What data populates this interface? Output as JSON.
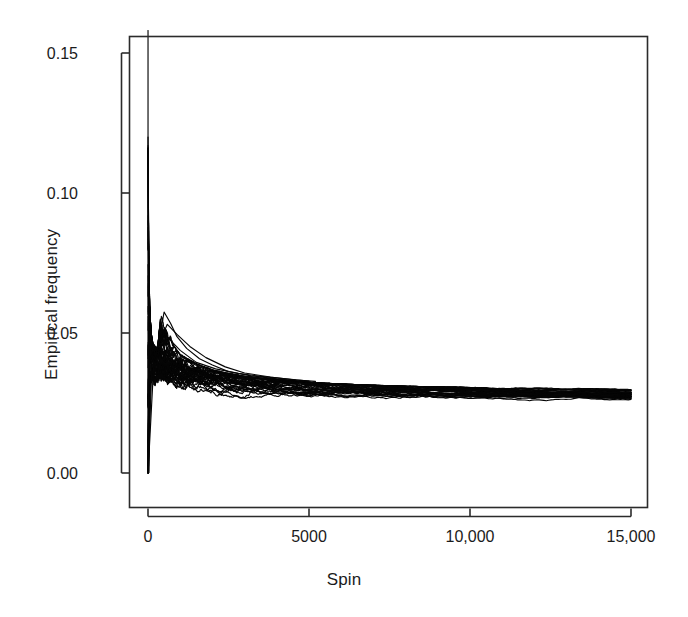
{
  "chart_data": {
    "type": "line",
    "title": "",
    "subtitle": "",
    "xlabel": "Spin",
    "ylabel": "Empirical frequency",
    "xlim": [
      -300,
      15600
    ],
    "ylim": [
      -0.0125,
      0.1585
    ],
    "grid": false,
    "legend": "none",
    "annotations": [],
    "xticks": [
      0,
      5000,
      10000,
      15000
    ],
    "xtick_labels": [
      "0",
      "5000",
      "10,000",
      "15,000"
    ],
    "yticks": [
      0.0,
      0.05,
      0.1,
      0.15
    ],
    "ytick_labels": [
      "0.00",
      "0.05",
      "0.10",
      "0.15"
    ],
    "series_count": 38,
    "converged_value": 0.0263,
    "final_band": [
      0.0243,
      0.0307
    ],
    "x": [
      1,
      10,
      25,
      50,
      75,
      100,
      150,
      200,
      300,
      400,
      500,
      650,
      800,
      1000,
      1250,
      1500,
      1800,
      2100,
      2500,
      3000,
      3500,
      4000,
      4500,
      5000,
      5500,
      6000,
      6500,
      7000,
      7500,
      8000,
      8500,
      9000,
      9500,
      10000,
      10500,
      11000,
      11500,
      12000,
      12500,
      13000,
      13500,
      14000,
      14500,
      15000
    ],
    "envelope_upper": [
      0.158,
      0.1,
      0.08,
      0.06,
      0.0545,
      0.05,
      0.0465,
      0.0455,
      0.0445,
      0.0575,
      0.057,
      0.0505,
      0.0455,
      0.0425,
      0.0408,
      0.0392,
      0.0378,
      0.0366,
      0.0356,
      0.0346,
      0.0339,
      0.0334,
      0.0329,
      0.0325,
      0.0321,
      0.0318,
      0.0316,
      0.0314,
      0.0312,
      0.031,
      0.0309,
      0.0308,
      0.0307,
      0.0306,
      0.0305,
      0.0304,
      0.0304,
      0.0303,
      0.0303,
      0.0302,
      0.0302,
      0.0302,
      0.0301,
      0.0301
    ],
    "envelope_lower": [
      0.0,
      0.0,
      0.0,
      0.002,
      0.004,
      0.006,
      0.008,
      0.0095,
      0.0115,
      0.0128,
      0.0138,
      0.0152,
      0.0163,
      0.0175,
      0.0186,
      0.0194,
      0.0202,
      0.0208,
      0.0214,
      0.0219,
      0.0223,
      0.0226,
      0.0228,
      0.023,
      0.0232,
      0.0233,
      0.0234,
      0.0235,
      0.0236,
      0.0237,
      0.0238,
      0.0238,
      0.0239,
      0.0239,
      0.024,
      0.024,
      0.0241,
      0.0241,
      0.0241,
      0.0242,
      0.0242,
      0.0242,
      0.0243,
      0.0243
    ],
    "outlier_traces": [
      {
        "name": "high-outlier-a",
        "x": [
          1,
          100,
          300,
          500,
          700,
          900,
          1200,
          1600,
          2000,
          2500,
          3200,
          4000,
          5000
        ],
        "y": [
          0.0,
          0.04,
          0.0445,
          0.0575,
          0.0535,
          0.0487,
          0.0445,
          0.0408,
          0.0386,
          0.0362,
          0.0347,
          0.0336,
          0.0325
        ]
      },
      {
        "name": "high-outlier-b",
        "x": [
          1,
          120,
          350,
          600,
          900,
          1300,
          1800,
          2400,
          3000,
          3800,
          4600,
          5200
        ],
        "y": [
          0.0,
          0.038,
          0.0465,
          0.0531,
          0.0495,
          0.0452,
          0.0412,
          0.0379,
          0.0357,
          0.0343,
          0.0332,
          0.0327
        ]
      },
      {
        "name": "high-outlier-c",
        "x": [
          1,
          200,
          500,
          1000,
          1500,
          2100,
          2800,
          3500,
          4200,
          5000
        ],
        "y": [
          0.0,
          0.0435,
          0.0498,
          0.0438,
          0.0395,
          0.0372,
          0.0356,
          0.0345,
          0.0337,
          0.0328
        ]
      }
    ]
  },
  "axes": {
    "x_title": "Spin",
    "y_title": "Empirical frequency"
  }
}
